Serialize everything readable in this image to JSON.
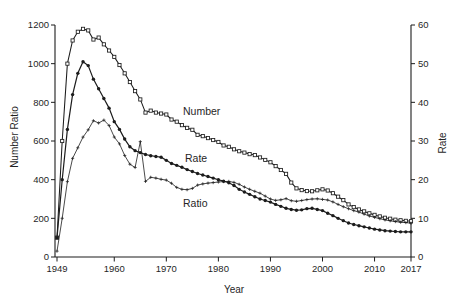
{
  "figure": {
    "background": "#ffffff",
    "line_color": "#1c1c1c",
    "tick_label_color": "#1f1f1f"
  },
  "chart_data": {
    "type": "line",
    "title": "",
    "xlabel": "Year",
    "ylabel_left": "Number Ratio",
    "ylabel_right": "Rate",
    "grid": false,
    "legend": "inline-labels",
    "x_range": [
      1949,
      2017
    ],
    "y_range_left": [
      0,
      1200
    ],
    "y_range_right": [
      0,
      60
    ],
    "x_ticks": [
      "1949",
      "1960",
      "1970",
      "1980",
      "1990",
      "2000",
      "2010",
      "2017"
    ],
    "x_tick_years": [
      1949,
      1960,
      1970,
      1980,
      1990,
      2000,
      2010,
      2017
    ],
    "y_ticks_left": [
      0,
      200,
      400,
      600,
      800,
      1000,
      1200
    ],
    "y_ticks_right": [
      0,
      10,
      20,
      30,
      40,
      50,
      60
    ],
    "inline_labels": [
      {
        "text": "Number",
        "series": "Number"
      },
      {
        "text": "Rate",
        "series": "Rate"
      },
      {
        "text": "Ratio",
        "series": "Ratio"
      }
    ],
    "years": [
      1949,
      1950,
      1951,
      1952,
      1953,
      1954,
      1955,
      1956,
      1957,
      1958,
      1959,
      1960,
      1961,
      1962,
      1963,
      1964,
      1965,
      1966,
      1967,
      1968,
      1969,
      1970,
      1971,
      1972,
      1973,
      1974,
      1975,
      1976,
      1977,
      1978,
      1979,
      1980,
      1981,
      1982,
      1983,
      1984,
      1985,
      1986,
      1987,
      1988,
      1989,
      1990,
      1991,
      1992,
      1993,
      1994,
      1995,
      1996,
      1997,
      1998,
      1999,
      2000,
      2001,
      2002,
      2003,
      2004,
      2005,
      2006,
      2007,
      2008,
      2009,
      2010,
      2011,
      2012,
      2013,
      2014,
      2015,
      2016,
      2017
    ],
    "series": [
      {
        "name": "Number",
        "axis": "left",
        "marker": "open-square",
        "values": [
          100,
          600,
          1000,
          1120,
          1165,
          1180,
          1172,
          1125,
          1135,
          1100,
          1068,
          1035,
          993,
          950,
          905,
          858,
          815,
          747,
          757,
          747,
          742,
          737,
          711,
          700,
          682,
          668,
          658,
          632,
          625,
          615,
          605,
          595,
          577,
          570,
          557,
          547,
          540,
          532,
          527,
          515,
          502,
          490,
          470,
          450,
          430,
          385,
          355,
          346,
          341,
          340,
          345,
          350,
          344,
          330,
          312,
          294,
          272,
          258,
          246,
          236,
          226,
          218,
          210,
          203,
          198,
          193,
          190,
          187,
          185
        ]
      },
      {
        "name": "Rate",
        "axis": "right",
        "marker": "filled-circle",
        "values": [
          5,
          20,
          33,
          42,
          47.5,
          50.5,
          49.5,
          46,
          43.5,
          41,
          38.5,
          35,
          33,
          30.5,
          28.5,
          27.5,
          27,
          26.5,
          26.2,
          26,
          25.8,
          25,
          24.2,
          23.7,
          23.2,
          22.6,
          22.1,
          21.6,
          21.2,
          20.8,
          20.4,
          20,
          19.6,
          19.2,
          18.5,
          17.5,
          16.8,
          16.2,
          15.6,
          15,
          14.6,
          14.2,
          13.6,
          13.1,
          12.6,
          12.3,
          12.1,
          12.2,
          12.5,
          12.6,
          12.3,
          12,
          11.3,
          10.7,
          10,
          9.4,
          8.8,
          8.4,
          8.1,
          7.8,
          7.5,
          7.2,
          7,
          6.8,
          6.7,
          6.6,
          6.5,
          6.5,
          6.5
        ]
      },
      {
        "name": "Ratio",
        "axis": "left",
        "marker": "plus",
        "values": [
          30,
          200,
          390,
          510,
          565,
          620,
          658,
          705,
          693,
          708,
          680,
          620,
          585,
          525,
          480,
          463,
          597,
          391,
          412,
          408,
          402,
          398,
          381,
          360,
          350,
          348,
          355,
          372,
          378,
          382,
          385,
          388,
          390,
          391,
          386,
          376,
          362,
          350,
          340,
          330,
          315,
          300,
          293,
          296,
          302,
          291,
          288,
          292,
          297,
          300,
          301,
          298,
          295,
          285,
          272,
          260,
          250,
          240,
          232,
          222,
          212,
          205,
          198,
          192,
          187,
          183,
          180,
          178,
          175
        ]
      }
    ]
  }
}
